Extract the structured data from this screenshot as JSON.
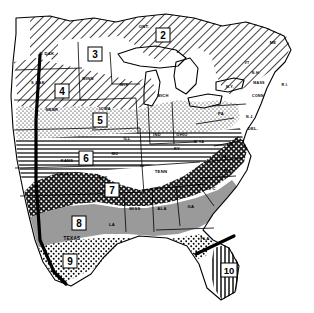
{
  "figure": {
    "background_color": "#ffffff",
    "ink_color": "#000000",
    "width_px": 314,
    "height_px": 313
  },
  "zones": [
    {
      "id": "zone-1",
      "number": "1",
      "label_x": 36,
      "label_y": 38,
      "pattern": "diagonal-hatch",
      "pattern_name": "diagonal hatching",
      "visible": false
    },
    {
      "id": "zone-2",
      "number": "2",
      "label_x": 163,
      "label_y": 36,
      "pattern": "diagonal-hatch",
      "pattern_name": "diagonal hatching",
      "visible": true
    },
    {
      "id": "zone-3",
      "number": "3",
      "label_x": 95,
      "label_y": 55,
      "pattern": "blank",
      "pattern_name": "blank / white",
      "visible": true
    },
    {
      "id": "zone-4",
      "number": "4",
      "label_x": 62,
      "label_y": 92,
      "pattern": "diagonal-hatch",
      "pattern_name": "diagonal hatching",
      "visible": true
    },
    {
      "id": "zone-5",
      "number": "5",
      "label_x": 100,
      "label_y": 121,
      "pattern": "stipple",
      "pattern_name": "fine stipple dots",
      "visible": true
    },
    {
      "id": "zone-6",
      "number": "6",
      "label_x": 86,
      "label_y": 159,
      "pattern": "horizontal-lines",
      "pattern_name": "horizontal ruling",
      "visible": true
    },
    {
      "id": "zone-7",
      "number": "7",
      "label_x": 112,
      "label_y": 191,
      "pattern": "crosshatch-dark",
      "pattern_name": "dark diamond crosshatch",
      "visible": true
    },
    {
      "id": "zone-8",
      "number": "8",
      "label_x": 79,
      "label_y": 224,
      "pattern": "solid-gray",
      "pattern_name": "solid mid gray",
      "visible": true
    },
    {
      "id": "zone-9",
      "number": "9",
      "label_x": 70,
      "label_y": 262,
      "pattern": "coarse-stipple",
      "pattern_name": "coarse stipple",
      "visible": true
    },
    {
      "id": "zone-10",
      "number": "10",
      "label_x": 229,
      "label_y": 271,
      "pattern": "vertical-lines",
      "pattern_name": "vertical ruling",
      "visible": true
    }
  ],
  "state_labels": [
    {
      "name": "ONT",
      "text": "ONT.",
      "x": 144,
      "y": 28
    },
    {
      "name": "N-DAK",
      "text": "N DAK",
      "x": 47,
      "y": 55
    },
    {
      "name": "MINN",
      "text": "MINN",
      "x": 88,
      "y": 80
    },
    {
      "name": "S-DAK",
      "text": "S DAK",
      "x": 38,
      "y": 84
    },
    {
      "name": "WIS",
      "text": "WIS",
      "x": 124,
      "y": 86
    },
    {
      "name": "MICH",
      "text": "MICH",
      "x": 163,
      "y": 97
    },
    {
      "name": "NEBR",
      "text": "NEBR",
      "x": 52,
      "y": 111
    },
    {
      "name": "IOWA",
      "text": "IOWA",
      "x": 105,
      "y": 110
    },
    {
      "name": "ILL",
      "text": "ILL",
      "x": 127,
      "y": 140
    },
    {
      "name": "IND",
      "text": "IND",
      "x": 157,
      "y": 136
    },
    {
      "name": "OHIO",
      "text": "OHIO",
      "x": 182,
      "y": 136
    },
    {
      "name": "PA",
      "text": "PA",
      "x": 221,
      "y": 115
    },
    {
      "name": "NY",
      "text": "N.Y.",
      "x": 230,
      "y": 88
    },
    {
      "name": "VT",
      "text": "VT",
      "x": 247,
      "y": 64
    },
    {
      "name": "NH",
      "text": "N.H.",
      "x": 256,
      "y": 74
    },
    {
      "name": "ME",
      "text": "ME",
      "x": 273,
      "y": 44
    },
    {
      "name": "MASS",
      "text": "MASS",
      "x": 259,
      "y": 84
    },
    {
      "name": "CONN",
      "text": "CONN",
      "x": 258,
      "y": 97
    },
    {
      "name": "RI",
      "text": "R.I.",
      "x": 283,
      "y": 86
    },
    {
      "name": "NJ",
      "text": "N.J.",
      "x": 248,
      "y": 118
    },
    {
      "name": "DEL",
      "text": "DEL.",
      "x": 251,
      "y": 130
    },
    {
      "name": "MD",
      "text": "MD.",
      "x": 231,
      "y": 146
    },
    {
      "name": "W-VA",
      "text": "W.VA",
      "x": 199,
      "y": 143
    },
    {
      "name": "VA",
      "text": "VA",
      "x": 224,
      "y": 158
    },
    {
      "name": "KY",
      "text": "KY",
      "x": 177,
      "y": 150
    },
    {
      "name": "KANS",
      "text": "KANS",
      "x": 67,
      "y": 162
    },
    {
      "name": "MO",
      "text": "MO",
      "x": 115,
      "y": 155
    },
    {
      "name": "OKLA",
      "text": "OKLA",
      "x": 63,
      "y": 175
    },
    {
      "name": "ARK",
      "text": "ARK",
      "x": 103,
      "y": 179
    },
    {
      "name": "TENN",
      "text": "TENN",
      "x": 161,
      "y": 173
    },
    {
      "name": "N-C",
      "text": "N C",
      "x": 228,
      "y": 172
    },
    {
      "name": "S-C",
      "text": "S C",
      "x": 212,
      "y": 190
    },
    {
      "name": "MISS",
      "text": "MISS",
      "x": 135,
      "y": 210
    },
    {
      "name": "ALA",
      "text": "ALA",
      "x": 162,
      "y": 210
    },
    {
      "name": "GA",
      "text": "GA",
      "x": 191,
      "y": 208
    },
    {
      "name": "LA",
      "text": "LA",
      "x": 112,
      "y": 226
    },
    {
      "name": "TEXAS",
      "text": "TEXAS",
      "x": 72,
      "y": 240
    },
    {
      "name": "FLA",
      "text": "FLA",
      "x": 205,
      "y": 240
    }
  ],
  "legend": {
    "zone_count": "10",
    "pattern_list": [
      "diagonal hatching",
      "blank / white",
      "fine stipple dots",
      "horizontal ruling",
      "dark diamond crosshatch",
      "solid mid gray",
      "coarse stipple",
      "vertical ruling"
    ]
  },
  "colors": {
    "ink": "#000000",
    "paper": "#ffffff",
    "gray_fill": "#9a9a9a",
    "dark_fill": "#3c3c3c"
  }
}
